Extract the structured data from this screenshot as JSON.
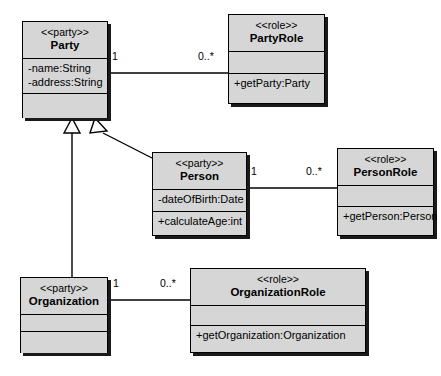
{
  "diagram": {
    "fill_color": "#d6d6d6",
    "line_color": "#000000",
    "shadow_color": "#1a1a1a",
    "background": "#ffffff"
  },
  "classes": [
    {
      "id": "party",
      "stereotype": "<<party>>",
      "name": "Party",
      "attributes": [
        "-name:String",
        "-address:String"
      ],
      "operations": []
    },
    {
      "id": "party_role",
      "stereotype": "<<role>>",
      "name": "PartyRole",
      "attributes": [],
      "operations": [
        "+getParty:Party"
      ]
    },
    {
      "id": "person",
      "stereotype": "<<party>>",
      "name": "Person",
      "attributes": [
        "-dateOfBirth:Date"
      ],
      "operations": [
        "+calculateAge:int"
      ]
    },
    {
      "id": "person_role",
      "stereotype": "<<role>>",
      "name": "PersonRole",
      "attributes": [],
      "operations": [
        "+getPerson:Person"
      ]
    },
    {
      "id": "organization",
      "stereotype": "<<party>>",
      "name": "Organization",
      "attributes": [],
      "operations": []
    },
    {
      "id": "organization_role",
      "stereotype": "<<role>>",
      "name": "OrganizationRole",
      "attributes": [],
      "operations": [
        "+getOrganization:Organization"
      ]
    }
  ],
  "associations": [
    {
      "id": "party_partyrole",
      "from": "Party",
      "to": "PartyRole",
      "from_multiplicity": "1",
      "to_multiplicity": "0..*"
    },
    {
      "id": "person_personrole",
      "from": "Person",
      "to": "PersonRole",
      "from_multiplicity": "1",
      "to_multiplicity": "0..*"
    },
    {
      "id": "organization_organizationrole",
      "from": "Organization",
      "to": "OrganizationRole",
      "from_multiplicity": "1",
      "to_multiplicity": "0..*"
    }
  ],
  "generalizations": [
    {
      "id": "person_party",
      "subclass": "Person",
      "superclass": "Party"
    },
    {
      "id": "organization_party",
      "subclass": "Organization",
      "superclass": "Party"
    }
  ]
}
